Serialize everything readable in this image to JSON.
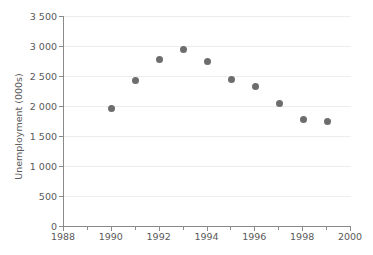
{
  "chart_data": {
    "type": "scatter",
    "title": "",
    "xlabel": "",
    "ylabel": "Unemployment (000s)",
    "xlim": [
      1988,
      2000
    ],
    "ylim": [
      0,
      3500
    ],
    "grid": true,
    "legend": "none",
    "marker_color": "#6d6d6d",
    "gridline_color": "#ededed",
    "axis_color": "#8a8a8a",
    "text_color": "#595959",
    "x": [
      1990,
      1991,
      1992,
      1993,
      1994,
      1995,
      1996,
      1997,
      1998,
      1999
    ],
    "values": [
      1960,
      2420,
      2780,
      2950,
      2750,
      2450,
      2330,
      2040,
      1770,
      1740
    ],
    "points": [
      {
        "x": 1990,
        "y": 1960
      },
      {
        "x": 1991,
        "y": 2420
      },
      {
        "x": 1992,
        "y": 2780
      },
      {
        "x": 1993,
        "y": 2950
      },
      {
        "x": 1994,
        "y": 2750
      },
      {
        "x": 1995,
        "y": 2450
      },
      {
        "x": 1996,
        "y": 2330
      },
      {
        "x": 1997,
        "y": 2040
      },
      {
        "x": 1998,
        "y": 1770
      },
      {
        "x": 1999,
        "y": 1740
      }
    ],
    "y_ticks": [
      0,
      500,
      1000,
      1500,
      2000,
      2500,
      3000,
      3500
    ],
    "y_tick_labels": [
      "0",
      "500",
      "1 000",
      "1 500",
      "2 000",
      "2 500",
      "3 000",
      "3 500"
    ],
    "x_ticks": [
      1988,
      1990,
      1992,
      1994,
      1996,
      1998,
      2000
    ],
    "x_tick_labels": [
      "1988",
      "1990",
      "1992",
      "1994",
      "1996",
      "1998",
      "2000"
    ],
    "x_minor_ticks": [
      1989,
      1991,
      1993,
      1995,
      1997,
      1999
    ]
  }
}
